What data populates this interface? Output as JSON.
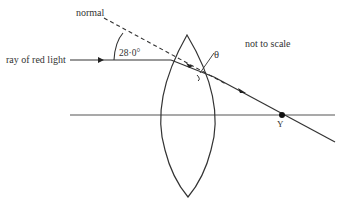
{
  "diagram": {
    "labels": {
      "normal": "normal",
      "ray": "ray of red light",
      "angle": "28·0°",
      "theta": "θ",
      "scale_note": "not to scale",
      "point": "Y"
    },
    "colors": {
      "line": "#333333",
      "text": "#333333",
      "background": "#ffffff"
    }
  }
}
